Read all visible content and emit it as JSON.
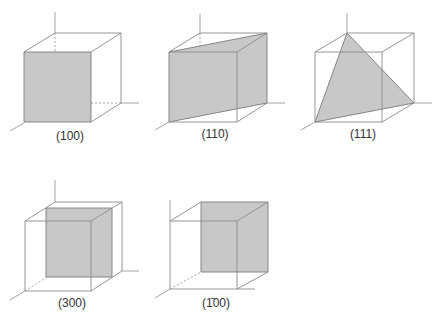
{
  "figure": {
    "panels": [
      {
        "id": "p100",
        "label": "(100)",
        "plane": "front face of cube (x = 1)"
      },
      {
        "id": "p110",
        "label": "(110)",
        "plane": "diagonal plane through front-left vertical edge and back-right vertical edge"
      },
      {
        "id": "p111",
        "label": "(111)",
        "plane": "triangle through three axis intercepts"
      },
      {
        "id": "p300",
        "label": "(300)",
        "plane": "plane parallel to front face at 1/3 depth"
      },
      {
        "id": "p-100",
        "label": "(1̄00)",
        "plane": "back face of cube (x = -1 side)"
      }
    ],
    "colors": {
      "plane_fill": "#c8c8c8",
      "edge": "#8a8a8a",
      "plane_edge": "#7a7a7a",
      "label": "#333333"
    }
  }
}
